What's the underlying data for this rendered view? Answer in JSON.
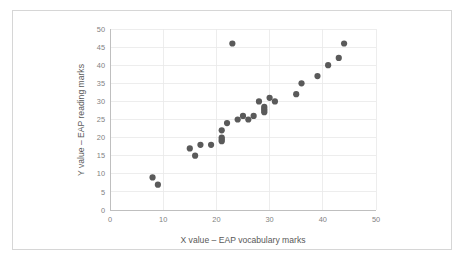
{
  "figure": {
    "border_color": "#d6d6d6",
    "background": "#ffffff"
  },
  "chart_data": {
    "type": "scatter",
    "title": "",
    "xlabel": "X value – EAP vocabulary marks",
    "ylabel": "Y value – EAP reading marks",
    "xlim": [
      0,
      50
    ],
    "ylim": [
      0,
      50
    ],
    "xticks": [
      0,
      10,
      20,
      30,
      40,
      50
    ],
    "yticks": [
      0,
      5,
      10,
      15,
      20,
      25,
      30,
      35,
      40,
      45,
      50
    ],
    "xtick_labels": [
      "0",
      "10",
      "20",
      "30",
      "40",
      "50"
    ],
    "ytick_labels": [
      "0",
      "5",
      "10",
      "15",
      "20",
      "25",
      "30",
      "35",
      "40",
      "45",
      "50"
    ],
    "grid": {
      "horizontal": true,
      "vertical": true,
      "color": "#e8e8e8"
    },
    "legend": {
      "visible": false,
      "position": "none"
    },
    "marker": {
      "shape": "circle",
      "color": "#5a5a5a",
      "size": 3.1
    },
    "series": [
      {
        "name": "EAP marks",
        "points": [
          [
            8,
            9
          ],
          [
            9,
            7
          ],
          [
            15,
            17
          ],
          [
            16,
            15
          ],
          [
            17,
            18
          ],
          [
            19,
            18
          ],
          [
            21,
            22
          ],
          [
            21,
            20
          ],
          [
            21,
            19.5
          ],
          [
            21,
            19
          ],
          [
            22,
            24
          ],
          [
            23,
            46
          ],
          [
            24,
            25
          ],
          [
            25,
            26
          ],
          [
            26,
            25
          ],
          [
            27,
            26
          ],
          [
            28,
            30
          ],
          [
            29,
            28.5
          ],
          [
            29,
            28
          ],
          [
            29,
            27.5
          ],
          [
            29,
            27
          ],
          [
            30,
            31
          ],
          [
            31,
            30
          ],
          [
            35,
            32
          ],
          [
            36,
            35
          ],
          [
            39,
            37
          ],
          [
            41,
            40
          ],
          [
            43,
            42
          ],
          [
            44,
            46
          ]
        ]
      }
    ]
  }
}
